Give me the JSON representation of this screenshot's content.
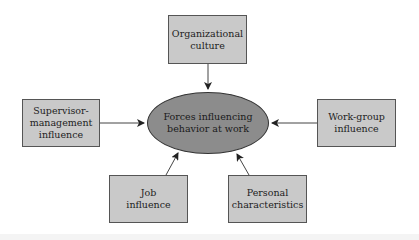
{
  "diagram": {
    "center": {
      "line1": "Forces influencing",
      "line2": "behavior at work"
    },
    "nodes": {
      "organizational_culture": {
        "line1": "Organizational",
        "line2": "culture"
      },
      "supervisor_management": {
        "line1": "Supervisor-",
        "line2": "management",
        "line3": "influence"
      },
      "work_group": {
        "line1": "Work-group",
        "line2": "influence"
      },
      "job": {
        "line1": "Job",
        "line2": "influence"
      },
      "personal": {
        "line1": "Personal",
        "line2": "characteristics"
      }
    },
    "colors": {
      "box_fill": "#c9c9c9",
      "ellipse_fill": "#8c8c8c",
      "stroke": "#333333"
    }
  }
}
